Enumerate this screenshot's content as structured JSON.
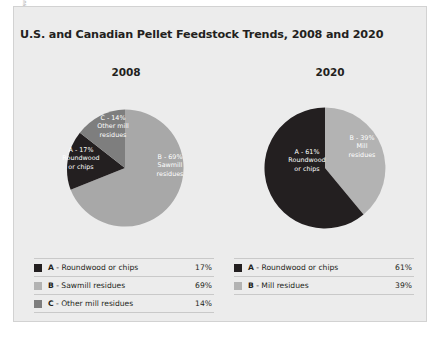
{
  "source_credit": "SOURCE: SPELTER AND TOTH (2009); FORISK CONSULTING",
  "title": "U.S. and Canadian Pellet Feedstock Trends, 2008 and 2020",
  "years": {
    "left": "2008",
    "right": "2020"
  },
  "colors": {
    "roundwood": "#231f20",
    "sawmill_residues": "#a8a8a8",
    "other_mill_residues": "#7e7e7e",
    "mill_residues": "#b3b3b3",
    "panel_background": "#ececec",
    "panel_border": "#d2d2d2",
    "text": "#231f20",
    "label_text": "#ffffff",
    "rule": "#c9c9c9"
  },
  "slice_labels": {
    "y2008_c": "C - 14%\nOther mill\nresidues",
    "y2008_a": "A - 17%\nRoundwood\nor chips",
    "y2008_b": "B - 69%\nSawmill\nresidues",
    "y2020_a": "A - 61%\nRoundwood\nor chips",
    "y2020_b": "B - 39%\nMill\nresidues"
  },
  "legend_2008": [
    {
      "key": "A",
      "label": " - Roundwood or chips",
      "pct": "17%",
      "color": "#231f20"
    },
    {
      "key": "B",
      "label": " - Sawmill residues",
      "pct": "69%",
      "color": "#b3b3b3"
    },
    {
      "key": "C",
      "label": " - Other mill residues",
      "pct": "14%",
      "color": "#7e7e7e"
    }
  ],
  "legend_2020": [
    {
      "key": "A",
      "label": " - Roundwood or chips",
      "pct": "61%",
      "color": "#231f20"
    },
    {
      "key": "B",
      "label": " - Mill residues",
      "pct": "39%",
      "color": "#b3b3b3"
    }
  ],
  "chart_data": [
    {
      "type": "pie",
      "title": "2008",
      "categories": [
        "A - Roundwood or chips",
        "B - Sawmill residues",
        "C - Other mill residues"
      ],
      "values": [
        17,
        69,
        14
      ],
      "units": "percent",
      "colors": [
        "#231f20",
        "#a8a8a8",
        "#7e7e7e"
      ],
      "start_angle_deg": 0,
      "direction": "clockwise",
      "slice_order": [
        "B - Sawmill residues",
        "A - Roundwood or chips",
        "C - Other mill residues"
      ],
      "legend_position": "below"
    },
    {
      "type": "pie",
      "title": "2020",
      "categories": [
        "A - Roundwood or chips",
        "B - Mill residues"
      ],
      "values": [
        61,
        39
      ],
      "units": "percent",
      "colors": [
        "#231f20",
        "#b3b3b3"
      ],
      "start_angle_deg": 0,
      "direction": "clockwise",
      "slice_order": [
        "B - Mill residues",
        "A - Roundwood or chips"
      ],
      "legend_position": "below"
    }
  ]
}
